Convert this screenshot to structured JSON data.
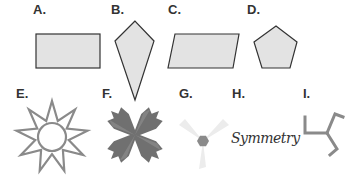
{
  "figures": [
    {
      "label": "A.",
      "shape": "rectangle-icon"
    },
    {
      "label": "B.",
      "shape": "kite-icon"
    },
    {
      "label": "C.",
      "shape": "parallelogram-icon"
    },
    {
      "label": "D.",
      "shape": "pentagon-icon"
    },
    {
      "label": "E.",
      "shape": "nine-point-star-icon"
    },
    {
      "label": "F.",
      "shape": "four-arm-starburst-icon"
    },
    {
      "label": "G.",
      "shape": "propeller-hexagon-icon"
    },
    {
      "label": "H.",
      "shape": "symmetry-word",
      "text": "Symmetry"
    },
    {
      "label": "I.",
      "shape": "three-arm-bent-icon"
    }
  ],
  "colors": {
    "fill": "#e3e3e3",
    "stroke": "#333333",
    "gray": "#8a8a8a",
    "dark_gray": "#6e6e6e",
    "light_gray": "#e9e9e9"
  }
}
